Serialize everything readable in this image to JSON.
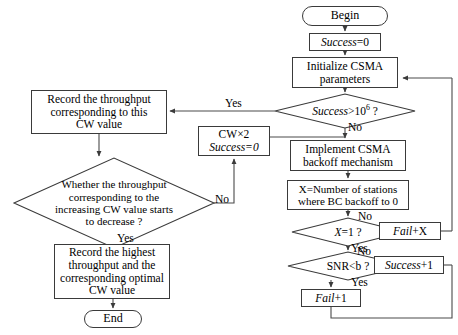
{
  "diagram": {
    "type": "flowchart",
    "canvas": {
      "width": 458,
      "height": 335
    },
    "colors": {
      "stroke": "#3a3a3a",
      "wire": "#4a4a4a",
      "background": "#ffffff",
      "text": "#000000"
    },
    "nodes": [
      {
        "id": "begin",
        "shape": "terminator",
        "label": "Begin",
        "x": 302,
        "y": 6,
        "w": 86,
        "h": 20,
        "font": 12
      },
      {
        "id": "success-init",
        "shape": "process",
        "label": "Success=0",
        "label_italic_prefix": "Success",
        "label_rest": "=0",
        "x": 309,
        "y": 33,
        "w": 72,
        "h": 18,
        "font": 11.5
      },
      {
        "id": "init-csma",
        "shape": "process",
        "label_lines": [
          "Initialize CSMA",
          "parameters"
        ],
        "x": 292,
        "y": 57,
        "w": 106,
        "h": 31,
        "font": 11.5
      },
      {
        "id": "success-gt",
        "shape": "decision",
        "label": "Success>10^6 ?",
        "label_italic_prefix": "Success",
        "label_rest": ">10",
        "label_sup": "6",
        "label_tail": " ?",
        "x": 275,
        "y": 94,
        "w": 140,
        "h": 34,
        "font": 11.5
      },
      {
        "id": "implement-csma",
        "shape": "process",
        "label_lines": [
          "Implement CSMA",
          "backoff mechanism"
        ],
        "x": 290,
        "y": 140,
        "w": 116,
        "h": 31,
        "font": 11.5
      },
      {
        "id": "x-stations",
        "shape": "process",
        "label_lines": [
          "X=Number of stations",
          "where BC backoff to 0"
        ],
        "x": 287,
        "y": 180,
        "w": 122,
        "h": 30,
        "font": 11
      },
      {
        "id": "x-eq-1",
        "shape": "decision",
        "label": "X=1 ?",
        "label_italic_prefix": "X",
        "label_rest": "=1 ?",
        "x": 292,
        "y": 218,
        "w": 112,
        "h": 28,
        "font": 11.5
      },
      {
        "id": "snr-lt-b",
        "shape": "decision",
        "label": "SNR<b ?",
        "x": 288,
        "y": 252,
        "w": 120,
        "h": 28,
        "font": 11.5
      },
      {
        "id": "fail-plus-1",
        "shape": "process",
        "label": "Fail+1",
        "label_italic_prefix": "Fail",
        "label_rest": "+1",
        "x": 301,
        "y": 289,
        "w": 60,
        "h": 18,
        "font": 11.5
      },
      {
        "id": "fail-plus-x",
        "shape": "process",
        "label": "Fail+X",
        "label_italic_prefix": "Fail",
        "label_rest": "+X",
        "x": 379,
        "y": 222,
        "w": 62,
        "h": 18,
        "font": 11.5
      },
      {
        "id": "success-plus-1",
        "shape": "process",
        "label": "Success+1",
        "label_italic_prefix": "Success",
        "label_rest": "+1",
        "x": 374,
        "y": 256,
        "w": 70,
        "h": 18,
        "font": 11.5
      },
      {
        "id": "cw-times-2",
        "shape": "process",
        "label_lines": [
          "CW×2",
          "Success=0"
        ],
        "label_italic_line": 1,
        "x": 198,
        "y": 126,
        "w": 72,
        "h": 30,
        "font": 11.5
      },
      {
        "id": "record-throughput",
        "shape": "process",
        "label_lines": [
          "Record the throughput",
          "corresponding to this",
          "CW value"
        ],
        "x": 31,
        "y": 90,
        "w": 136,
        "h": 44,
        "font": 11.5
      },
      {
        "id": "whether-decrease",
        "shape": "decision",
        "label_lines": [
          "Whether the throughput",
          "corresponding to the",
          "increasing CW value starts",
          "to decrease ?"
        ],
        "x": 14,
        "y": 158,
        "w": 200,
        "h": 90,
        "font": 11
      },
      {
        "id": "record-highest",
        "shape": "process",
        "label_lines": [
          "Record the highest",
          "throughput and the",
          "corresponding optimal",
          "CW value"
        ],
        "x": 54,
        "y": 244,
        "w": 116,
        "h": 55,
        "font": 11.5
      },
      {
        "id": "end",
        "shape": "terminator",
        "label": "End",
        "x": 84,
        "y": 310,
        "w": 58,
        "h": 18,
        "font": 12
      }
    ],
    "edge_labels": [
      {
        "id": "yes-success-gt",
        "text": "Yes",
        "x": 225,
        "y": 98,
        "font": 11.5
      },
      {
        "id": "no-success-gt",
        "text": "No",
        "x": 348,
        "y": 122,
        "font": 11.5
      },
      {
        "id": "no-x-eq-1",
        "text": "No",
        "x": 358,
        "y": 211,
        "font": 11.5
      },
      {
        "id": "yes-x-eq-1",
        "text": "Yes",
        "x": 351,
        "y": 243,
        "font": 11.5
      },
      {
        "id": "no-snr",
        "text": "No",
        "x": 355,
        "y": 245,
        "font": 11.5
      },
      {
        "id": "yes-snr",
        "text": "Yes",
        "x": 351,
        "y": 277,
        "font": 11.5
      },
      {
        "id": "no-whether",
        "text": "No",
        "x": 216,
        "y": 195,
        "font": 11.5
      },
      {
        "id": "yes-whether",
        "text": "Yes",
        "x": 117,
        "y": 234,
        "font": 11.5
      }
    ]
  }
}
